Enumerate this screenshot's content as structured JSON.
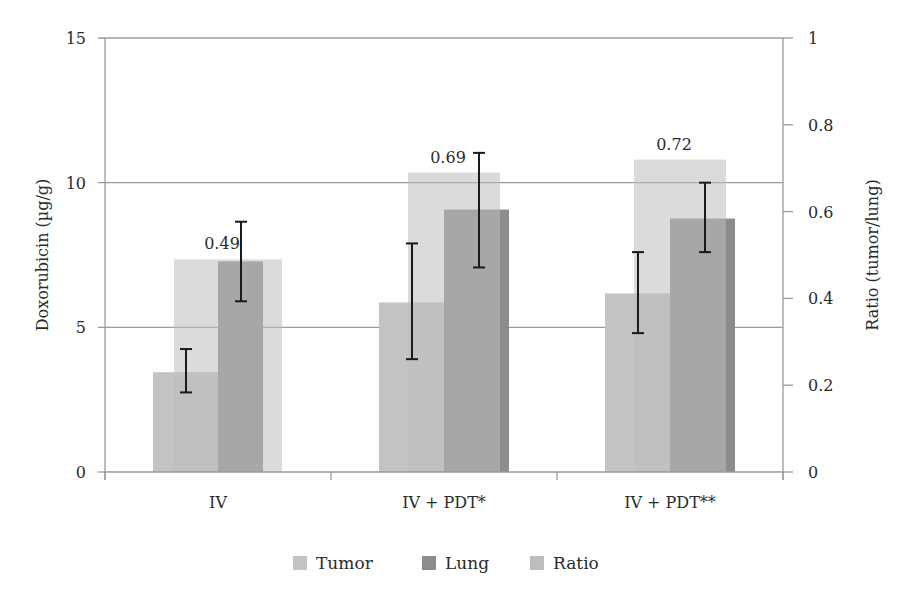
{
  "chart_data": {
    "type": "bar",
    "title": "",
    "categories": [
      "IV",
      "IV + PDT*",
      "IV + PDT**"
    ],
    "xlabel": "",
    "ylabel": "Doxorubicin (µg/g)",
    "ylabel_right": "Ratio (tumor/lung)",
    "ylim": [
      0,
      15
    ],
    "ylim_right": [
      0,
      1
    ],
    "yticks": [
      0,
      5,
      10,
      15
    ],
    "yticks_right": [
      0,
      0.2,
      0.4,
      0.6,
      0.8,
      1
    ],
    "grid": true,
    "legend_position": "bottom",
    "series": [
      {
        "name": "Tumor",
        "axis": "left",
        "color": "#c3c3c3",
        "values": [
          3.45,
          5.86,
          6.17
        ],
        "error_low": [
          2.75,
          3.9,
          4.8
        ],
        "error_high": [
          4.25,
          7.9,
          7.6
        ]
      },
      {
        "name": "Lung",
        "axis": "left",
        "color": "#8c8c8c",
        "values": [
          7.28,
          9.07,
          8.76
        ],
        "error_low": [
          5.9,
          7.07,
          7.6
        ],
        "error_high": [
          8.65,
          11.03,
          10.0
        ]
      },
      {
        "name": "Ratio",
        "axis": "right",
        "color": "#bdbdbd",
        "values": [
          0.49,
          0.69,
          0.72
        ],
        "labels": [
          "0.49",
          "0.69",
          "0.72"
        ]
      }
    ]
  }
}
